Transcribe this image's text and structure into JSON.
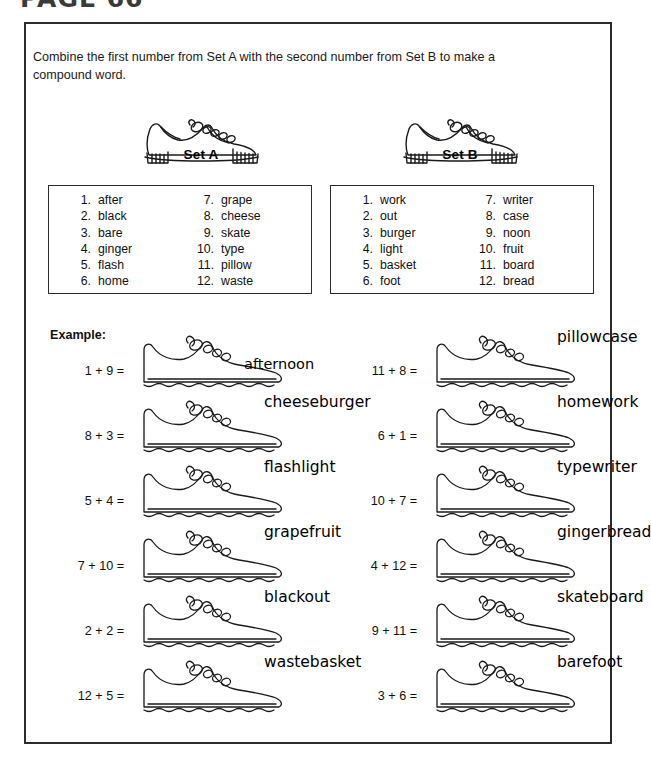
{
  "page": {
    "header": "PAGE 66"
  },
  "worksheet": {
    "instructions": "Combine the first number from Set A with the second number from Set B to make a compound word.",
    "example_label": "Example:",
    "set_a": {
      "label": "Set A",
      "icon": "sneaker-icon",
      "items": [
        {
          "num": "1.",
          "word": "after"
        },
        {
          "num": "2.",
          "word": "black"
        },
        {
          "num": "3.",
          "word": "bare"
        },
        {
          "num": "4.",
          "word": "ginger"
        },
        {
          "num": "5.",
          "word": "flash"
        },
        {
          "num": "6.",
          "word": "home"
        },
        {
          "num": "7.",
          "word": "grape"
        },
        {
          "num": "8.",
          "word": "cheese"
        },
        {
          "num": "9.",
          "word": "skate"
        },
        {
          "num": "10.",
          "word": "type"
        },
        {
          "num": "11.",
          "word": "pillow"
        },
        {
          "num": "12.",
          "word": "waste"
        }
      ]
    },
    "set_b": {
      "label": "Set B",
      "icon": "sneaker-icon",
      "items": [
        {
          "num": "1.",
          "word": "work"
        },
        {
          "num": "2.",
          "word": "out"
        },
        {
          "num": "3.",
          "word": "burger"
        },
        {
          "num": "4.",
          "word": "light"
        },
        {
          "num": "5.",
          "word": "basket"
        },
        {
          "num": "6.",
          "word": "foot"
        },
        {
          "num": "7.",
          "word": "writer"
        },
        {
          "num": "8.",
          "word": "case"
        },
        {
          "num": "9.",
          "word": "noon"
        },
        {
          "num": "10.",
          "word": "fruit"
        },
        {
          "num": "11.",
          "word": "board"
        },
        {
          "num": "12.",
          "word": "bread"
        }
      ]
    },
    "problems_left": [
      {
        "equation": "1 + 9 =",
        "answer": "afternoon",
        "answer_inside": true
      },
      {
        "equation": "8 + 3 =",
        "answer": "cheeseburger",
        "answer_inside": false
      },
      {
        "equation": "5 + 4 =",
        "answer": "flashlight",
        "answer_inside": false
      },
      {
        "equation": "7 + 10 =",
        "answer": "grapefruit",
        "answer_inside": false
      },
      {
        "equation": "2 + 2 =",
        "answer": "blackout",
        "answer_inside": false
      },
      {
        "equation": "12 + 5 =",
        "answer": "wastebasket",
        "answer_inside": false
      }
    ],
    "problems_right": [
      {
        "equation": "11 + 8 =",
        "answer": "pillowcase",
        "answer_inside": false
      },
      {
        "equation": "6 + 1 =",
        "answer": "homework",
        "answer_inside": false
      },
      {
        "equation": "10 + 7 =",
        "answer": "typewriter",
        "answer_inside": false
      },
      {
        "equation": "4 + 12 =",
        "answer": "gingerbread",
        "answer_inside": false
      },
      {
        "equation": "9 + 11 =",
        "answer": "skateboard",
        "answer_inside": false
      },
      {
        "equation": "3 + 6 =",
        "answer": "barefoot",
        "answer_inside": false
      }
    ]
  },
  "colors": {
    "ink": "#000000",
    "frame": "#2b2b2b",
    "header_gray": "#3a3a3a",
    "paper": "#ffffff"
  }
}
